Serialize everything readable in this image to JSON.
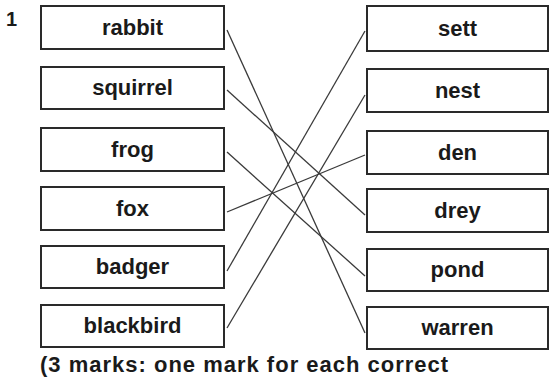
{
  "question": {
    "number": "1",
    "left_items": [
      {
        "label": "rabbit",
        "top": 5,
        "height": 45
      },
      {
        "label": "squirrel",
        "top": 66,
        "height": 44
      },
      {
        "label": "frog",
        "top": 127,
        "height": 45
      },
      {
        "label": "fox",
        "top": 186,
        "height": 45
      },
      {
        "label": "badger",
        "top": 245,
        "height": 44
      },
      {
        "label": "blackbird",
        "top": 304,
        "height": 44
      }
    ],
    "right_items": [
      {
        "label": "sett",
        "top": 5,
        "height": 47
      },
      {
        "label": "nest",
        "top": 68,
        "height": 45
      },
      {
        "label": "den",
        "top": 130,
        "height": 45
      },
      {
        "label": "drey",
        "top": 188,
        "height": 45
      },
      {
        "label": "pond",
        "top": 248,
        "height": 44
      },
      {
        "label": "warren",
        "top": 306,
        "height": 44
      }
    ],
    "matches": [
      {
        "from": "rabbit",
        "to": "warren",
        "x1": 227,
        "y1": 30,
        "x2": 365,
        "y2": 333
      },
      {
        "from": "squirrel",
        "to": "drey",
        "x1": 227,
        "y1": 90,
        "x2": 365,
        "y2": 215
      },
      {
        "from": "frog",
        "to": "pond",
        "x1": 227,
        "y1": 152,
        "x2": 365,
        "y2": 276
      },
      {
        "from": "fox",
        "to": "den",
        "x1": 227,
        "y1": 212,
        "x2": 365,
        "y2": 155
      },
      {
        "from": "badger",
        "to": "sett",
        "x1": 227,
        "y1": 271,
        "x2": 365,
        "y2": 31
      },
      {
        "from": "blackbird",
        "to": "nest",
        "x1": 227,
        "y1": 328,
        "x2": 365,
        "y2": 95
      }
    ],
    "footer_partial": "(3 marks: one mark for each correct"
  },
  "colors": {
    "line": "#3a3a3a",
    "border": "#2a2a2a",
    "text": "#1a1a1a"
  }
}
